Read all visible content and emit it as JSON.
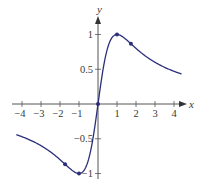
{
  "chart_data": {
    "type": "line",
    "title": "",
    "xlabel": "x",
    "ylabel": "y",
    "xlim": [
      -4.3,
      4.4
    ],
    "ylim": [
      -1.05,
      1.25
    ],
    "grid": false,
    "x_ticks": [
      -4,
      -3,
      -2,
      -1,
      1,
      2,
      3,
      4
    ],
    "x_tick_labels": [
      "−4",
      "−3",
      "−2",
      "−1",
      "1",
      "2",
      "3",
      "4"
    ],
    "y_ticks": [
      1,
      0.5,
      -0.5,
      -1
    ],
    "y_tick_labels": [
      "1",
      "0.5",
      "−0.5",
      "−1"
    ],
    "series": [
      {
        "name": "y = 2x/(1+x^2)",
        "color": "#2b2f7a",
        "x": [
          -4.3,
          -4,
          -3,
          -2,
          -1.732,
          -1.5,
          -1,
          -0.5,
          0,
          0.5,
          1,
          1.5,
          1.732,
          2,
          3,
          4,
          4.4
        ],
        "y": [
          -0.44,
          -0.47,
          -0.6,
          -0.8,
          -0.866,
          -0.923,
          -1.0,
          -0.8,
          0,
          0.8,
          1.0,
          0.923,
          0.866,
          0.8,
          0.6,
          0.47,
          0.43
        ]
      }
    ],
    "marked_points": [
      {
        "x": -1.732,
        "y": -0.866
      },
      {
        "x": -1,
        "y": -1
      },
      {
        "x": 0,
        "y": 0
      },
      {
        "x": 1,
        "y": 1
      },
      {
        "x": 1.732,
        "y": 0.866
      }
    ]
  }
}
